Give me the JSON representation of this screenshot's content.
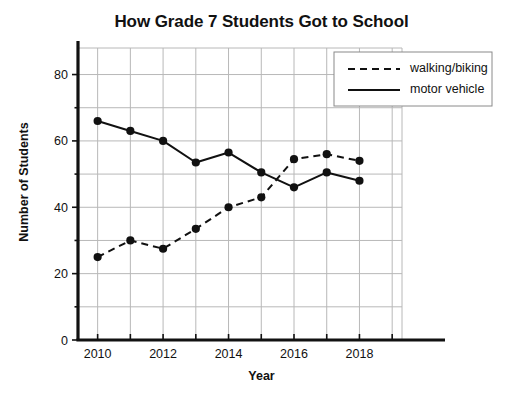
{
  "chart_data": {
    "type": "line",
    "title": "How Grade 7 Students Got to School",
    "xlabel": "Year",
    "ylabel": "Number of Students",
    "x": [
      2010,
      2011,
      2012,
      2013,
      2014,
      2015,
      2016,
      2017,
      2018
    ],
    "xlim": [
      2009.4,
      2019.3
    ],
    "ylim": [
      0,
      88
    ],
    "xticks": [
      2010,
      2011,
      2012,
      2013,
      2014,
      2015,
      2016,
      2017,
      2018,
      2019
    ],
    "xtick_labels_shown": [
      "2010",
      "2012",
      "2014",
      "2016",
      "2018"
    ],
    "yticks": [
      0,
      10,
      20,
      30,
      40,
      50,
      60,
      70,
      80
    ],
    "ytick_labels_shown": [
      "0",
      "20",
      "40",
      "60",
      "80"
    ],
    "grid": true,
    "legend_position": "top-right",
    "series": [
      {
        "name": "walking/biking",
        "style": "dashed",
        "color": "#111111",
        "marker": "circle",
        "values": [
          25,
          30,
          27.5,
          33.5,
          40,
          43,
          54.5,
          56,
          54
        ]
      },
      {
        "name": "motor vehicle",
        "style": "solid",
        "color": "#111111",
        "marker": "circle",
        "values": [
          66,
          63,
          60,
          53.5,
          56.5,
          50.5,
          46,
          50.5,
          48
        ]
      }
    ]
  },
  "legend": {
    "entries": [
      {
        "label": "walking/biking"
      },
      {
        "label": "motor vehicle"
      }
    ]
  },
  "colors": {
    "ink": "#111111",
    "grid": "#b8b8b8",
    "axis": "#111111",
    "background": "#ffffff"
  }
}
